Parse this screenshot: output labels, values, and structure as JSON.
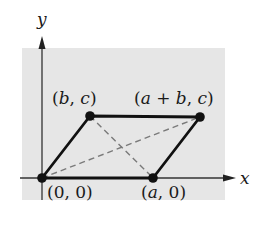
{
  "figure": {
    "type": "parallelogram-on-coordinate-plane",
    "background_color": "#e6e6e6",
    "line_color": "#111111",
    "diagonal_color": "#777777",
    "axes": {
      "x_label": "x",
      "y_label": "y"
    },
    "vertices": [
      {
        "id": "origin",
        "label": "(0, 0)",
        "parts": [
          "(0, 0)"
        ]
      },
      {
        "id": "a0",
        "label": "(a, 0)",
        "parts": [
          "(",
          "a",
          ", 0)"
        ]
      },
      {
        "id": "bc",
        "label": "(b, c)",
        "parts": [
          "(",
          "b",
          ", ",
          "c",
          ")"
        ]
      },
      {
        "id": "abc",
        "label": "(a + b, c)",
        "parts": [
          "(",
          "a",
          " + ",
          "b",
          ", ",
          "c",
          ")"
        ]
      }
    ],
    "edges": [
      {
        "from": "origin",
        "to": "a0",
        "style": "solid"
      },
      {
        "from": "a0",
        "to": "abc",
        "style": "solid"
      },
      {
        "from": "abc",
        "to": "bc",
        "style": "solid"
      },
      {
        "from": "bc",
        "to": "origin",
        "style": "solid"
      }
    ],
    "diagonals": [
      {
        "from": "origin",
        "to": "abc",
        "style": "dashed"
      },
      {
        "from": "bc",
        "to": "a0",
        "style": "dashed"
      }
    ]
  }
}
